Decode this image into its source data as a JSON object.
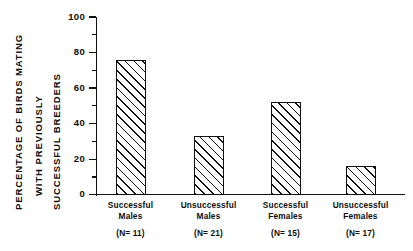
{
  "chart_data": {
    "type": "bar",
    "title": "",
    "subtitle": "",
    "xlabel": "",
    "ylabel": "PERCENTAGE OF BIRDS MATING WITH PREVIOUSLY SUCCESSFUL BREEDERS",
    "ylabel_lines": [
      "PERCENTAGE OF BIRDS MATING",
      "WITH PREVIOUSLY",
      "SUCCESSFUL BREEDERS"
    ],
    "categories": [
      "Successful Males",
      "Unsuccessful Males",
      "Successful Females",
      "Unsuccessful Females"
    ],
    "category_lines": [
      [
        "Successful",
        "Males"
      ],
      [
        "Unsuccessful",
        "Males"
      ],
      [
        "Successful",
        "Females"
      ],
      [
        "Unsuccessful",
        "Females"
      ]
    ],
    "sample_sizes": [
      "(N= 11)",
      "(N= 21)",
      "(N= 15)",
      "(N= 17)"
    ],
    "values": [
      76,
      33,
      52,
      16
    ],
    "ylim": [
      0,
      100
    ],
    "ytick_labels": [
      "0",
      "20",
      "40",
      "60",
      "80",
      "100"
    ],
    "ytick_values": [
      0,
      20,
      40,
      60,
      80,
      100
    ],
    "yminor_values": [
      10,
      30,
      50,
      70,
      90
    ],
    "grid": false,
    "legend": null,
    "bar_fill": "hatched-diagonal",
    "bar_edge_color": "#111111",
    "axis_color": "#111111",
    "background_color": "#ffffff"
  }
}
